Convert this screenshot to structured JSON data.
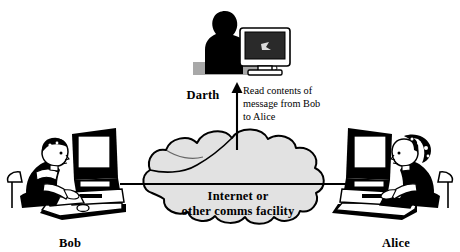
{
  "diagram": {
    "type": "security-attack-diagram",
    "colors": {
      "background": "#ffffff",
      "ink": "#000000",
      "cloud_fill": "#e2e2e2",
      "cloud_stroke": "#000000",
      "darth_silhouette": "#000000",
      "desk_shadow": "#a8a8a8"
    },
    "actors": [
      {
        "id": "bob",
        "label": "Bob",
        "role": "sender",
        "label_x": 70,
        "label_y": 243,
        "figure": "person-at-computer-facing-right"
      },
      {
        "id": "darth",
        "label": "Darth",
        "role": "attacker",
        "label_x": 203,
        "label_y": 99,
        "figure": "silhouette-person-at-computer"
      },
      {
        "id": "alice",
        "label": "Alice",
        "role": "receiver",
        "label_x": 396,
        "label_y": 243,
        "figure": "person-at-computer-facing-left"
      }
    ],
    "cloud": {
      "label_line1": "Internet or",
      "label_line2": "other comms facility",
      "center_x": 238,
      "line1_y": 197,
      "line2_y": 212
    },
    "annotation": {
      "text": "Read contents of\nmessage from Bob\nto Alice",
      "x": 243,
      "y": 85
    },
    "arrows": [
      {
        "id": "bob-to-alice",
        "from": "bob",
        "to": "alice",
        "direction": "horizontal-right",
        "y": 184,
        "x_start": 120,
        "x_end": 352
      },
      {
        "id": "cloud-to-darth",
        "from": "cloud",
        "to": "darth",
        "direction": "vertical-up",
        "x": 237,
        "y_start": 148,
        "y_end": 87
      }
    ]
  }
}
